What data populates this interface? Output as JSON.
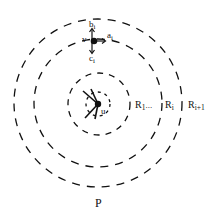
{
  "diagram": {
    "title": "P",
    "center_node": {
      "label": "u",
      "x": 98,
      "y": 104
    },
    "top_node": {
      "label": "v",
      "x": 94,
      "y": 41
    },
    "arrows": {
      "up_label": "b",
      "up_sub": "i",
      "right_label": "a",
      "right_sub": "i",
      "down_label": "c",
      "down_sub": "i"
    },
    "circles": [
      {
        "name": "inner-small",
        "r": 12
      },
      {
        "name": "R1",
        "r": 31
      },
      {
        "name": "Ri",
        "r": 64
      },
      {
        "name": "Ri+1",
        "r": 84
      }
    ],
    "ring_labels": {
      "r1": "R",
      "r1_sub": "1",
      "dots": "...",
      "ri": "R",
      "ri_sub": "i",
      "ri1": "R",
      "ri1_sub": "i+1"
    },
    "colors": {
      "ink": "#111111",
      "background": "#ffffff"
    }
  }
}
